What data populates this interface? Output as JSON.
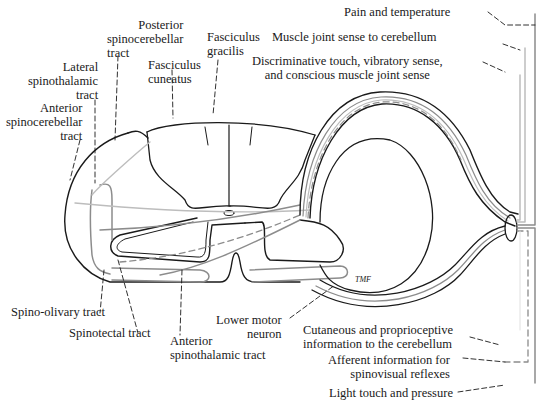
{
  "diagram": {
    "colors": {
      "outline": "#1a1a1a",
      "tract_gray": "#8c8c8c",
      "tract_light": "#bdbdbd"
    },
    "signature": "TMF"
  },
  "labels": {
    "posterior_spinocerebellar": [
      "Posterior",
      "spinocerebellar",
      "tract"
    ],
    "fasciculus_gracilis": [
      "Fasciculus",
      "gracilis"
    ],
    "fasciculus_cuneatus": [
      "Fasciculus",
      "cuneatus"
    ],
    "lateral_spinothalamic": [
      "Lateral",
      "spinothalamic",
      "tract"
    ],
    "anterior_spinocerebellar": [
      "Anterior",
      "spinocerebellar",
      "tract"
    ],
    "spino_olivary": "Spino-olivary tract",
    "spinotectal": "Spinotectal tract",
    "anterior_spinothalamic": [
      "Anterior",
      "spinothalamic tract"
    ],
    "lower_motor_neuron": [
      "Lower motor",
      "neuron"
    ],
    "pain_temperature": "Pain and temperature",
    "muscle_joint_cerebellum": "Muscle joint sense to cerebellum",
    "discriminative_touch": [
      "Discriminative touch, vibratory sense,",
      "and conscious muscle joint sense"
    ],
    "cutaneous_proprioceptive": [
      "Cutaneous and proprioceptive",
      "information to the cerebellum"
    ],
    "afferent_spinovisual": [
      "Afferent information for",
      "spinovisual reflexes"
    ],
    "light_touch_pressure": "Light touch and pressure"
  }
}
